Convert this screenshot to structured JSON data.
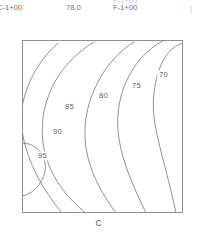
{
  "header": {
    "left_label": "C-1+00",
    "center_label": "78.0",
    "right_label": "F-1+00",
    "clipped_label": "F-1+00",
    "edge_mark": "|"
  },
  "plot": {
    "axis_caption": "C",
    "frame_color": "#8f8f8f",
    "contour_color": "#6d6d6d",
    "background": "#ffffff"
  },
  "chart_data": {
    "type": "contour",
    "title": "",
    "xlabel": "C",
    "ylabel": "",
    "grid": false,
    "legend": "none",
    "frame": {
      "x0": 0,
      "y0": 0,
      "x1": 161,
      "y1": 173
    },
    "levels": [
      70,
      75,
      80,
      85,
      90,
      95
    ],
    "level_labels": [
      "70",
      "75",
      "80",
      "85",
      "90",
      "95"
    ],
    "label_positions": [
      {
        "value": "70",
        "x": 137,
        "y": 37
      },
      {
        "value": "75",
        "x": 110,
        "y": 48
      },
      {
        "value": "80",
        "x": 77,
        "y": 58
      },
      {
        "value": "85",
        "x": 43,
        "y": 69
      },
      {
        "value": "90",
        "x": 31,
        "y": 94
      },
      {
        "value": "95",
        "x": 16,
        "y": 118
      }
    ],
    "contours": [
      {
        "value": 70,
        "path": "M 161 3 C 150 6 142 16 137 30 C 131 48 130 66 133 84 C 137 108 146 135 154 173"
      },
      {
        "value": 75,
        "path": "M 141 1 C 125 9 112 24 104 42 C 96 60 94 80 97 99 C 101 124 112 148 124 173"
      },
      {
        "value": 80,
        "path": "M 112 2 C 96 12 82 28 74 46 C 64 66 61 88 64 108 C 68 133 80 154 94 173"
      },
      {
        "value": 85,
        "path": "M 72 2 C 52 14 36 32 28 52 C 19 73 18 96 24 117 C 31 140 46 159 64 173"
      },
      {
        "value": 90,
        "path": "M 36 3 C 18 19 6 40 1 62 C -1 74 -1 84 1 96 C 6 122 20 149 40 173"
      },
      {
        "value": 95,
        "path": "M 0 103 C 9 103 17 108 21 116 C 25 125 24 135 18 143 C 13 151 6 155 0 156"
      }
    ]
  }
}
